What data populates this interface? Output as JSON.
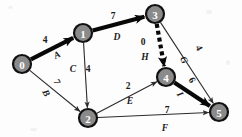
{
  "diagram": {
    "type": "pert-cpm-activity-network",
    "title": "",
    "nodes": [
      {
        "id": "0",
        "label": "0",
        "x": 22,
        "y": 64,
        "r": 9
      },
      {
        "id": "1",
        "label": "1",
        "x": 83,
        "y": 33,
        "r": 9
      },
      {
        "id": "2",
        "label": "2",
        "x": 88,
        "y": 118,
        "r": 9
      },
      {
        "id": "3",
        "label": "3",
        "x": 155,
        "y": 14,
        "r": 9
      },
      {
        "id": "4",
        "label": "4",
        "x": 166,
        "y": 77,
        "r": 9
      },
      {
        "id": "5",
        "label": "5",
        "x": 219,
        "y": 112,
        "r": 9
      }
    ],
    "edges": [
      {
        "id": "edge-0-1",
        "from": "0",
        "to": "1",
        "activity": "A",
        "duration": "4",
        "style": "thick-critical",
        "duration_label": {
          "x": 45,
          "y": 40
        },
        "activity_label": {
          "x": 57,
          "y": 55,
          "rotate": -27
        }
      },
      {
        "id": "edge-0-2",
        "from": "0",
        "to": "2",
        "activity": "B",
        "duration": "7",
        "style": "thin",
        "duration_label": {
          "x": 57,
          "y": 82,
          "rotate": 63
        },
        "activity_label": {
          "x": 46,
          "y": 93,
          "rotate": 63
        }
      },
      {
        "id": "edge-1-2",
        "from": "1",
        "to": "2",
        "activity": "C",
        "duration": "4",
        "style": "thin",
        "duration_label": {
          "x": 88,
          "y": 69
        },
        "activity_label": {
          "x": 73,
          "y": 69
        }
      },
      {
        "id": "edge-1-3",
        "from": "1",
        "to": "3",
        "activity": "D",
        "duration": "7",
        "style": "thick-critical",
        "duration_label": {
          "x": 113,
          "y": 16
        },
        "activity_label": {
          "x": 117,
          "y": 37
        }
      },
      {
        "id": "edge-3-4",
        "from": "3",
        "to": "4",
        "activity": "H",
        "duration": "0",
        "style": "dashed-critical",
        "duration_label": {
          "x": 143,
          "y": 42
        },
        "activity_label": {
          "x": 145,
          "y": 57
        }
      },
      {
        "id": "edge-3-5",
        "from": "3",
        "to": "5",
        "activity": "G",
        "duration": "4",
        "style": "thin",
        "duration_label": {
          "x": 199,
          "y": 48,
          "rotate": 63
        },
        "activity_label": {
          "x": 184,
          "y": 60,
          "rotate": 63
        }
      },
      {
        "id": "edge-2-4",
        "from": "2",
        "to": "4",
        "activity": "E",
        "duration": "2",
        "style": "thin",
        "duration_label": {
          "x": 128,
          "y": 86
        },
        "activity_label": {
          "x": 130,
          "y": 101
        }
      },
      {
        "id": "edge-2-5",
        "from": "2",
        "to": "5",
        "activity": "F",
        "duration": "7",
        "style": "thin",
        "duration_label": {
          "x": 167,
          "y": 110
        },
        "activity_label": {
          "x": 165,
          "y": 128
        }
      },
      {
        "id": "edge-4-5",
        "from": "4",
        "to": "5",
        "activity": "I",
        "duration": "6",
        "style": "thick-critical",
        "duration_label": {
          "x": 192,
          "y": 80,
          "rotate": 60
        },
        "activity_label": {
          "x": 180,
          "y": 94,
          "rotate": 60
        }
      }
    ],
    "colors": {
      "node_fill": "#8a8a8a",
      "node_stroke": "#111111",
      "node_text": "#ffffff",
      "edge_thin": "#2b2b2b",
      "edge_critical": "#080808",
      "background": "#fdfdfd"
    },
    "legend": {
      "critical_path": "0-1-3-4-5",
      "critical_activities": "A, D, H, I"
    }
  }
}
